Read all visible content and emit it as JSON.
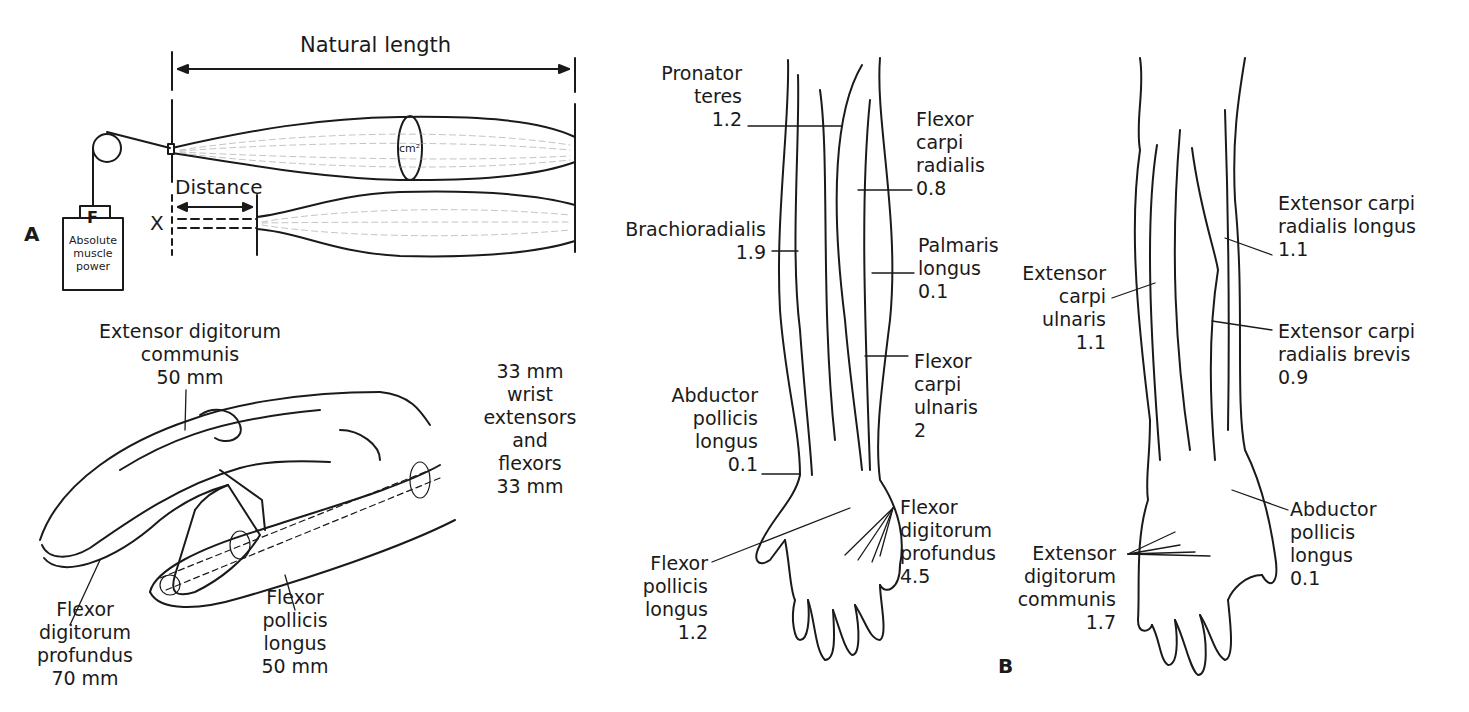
{
  "panel_a": {
    "letter": "A",
    "natural_length_label": "Natural length",
    "distance_label": "Distance",
    "cross_section_label": "cm²",
    "x_label": "X",
    "force_label": "F",
    "box_label": [
      "Absolute",
      "muscle",
      "power"
    ]
  },
  "hand_figure": {
    "edc": {
      "name": [
        "Extensor digitorum",
        "communis"
      ],
      "value": "50 mm"
    },
    "wrist": {
      "lines": [
        "33 mm",
        "wrist",
        "extensors",
        "and",
        "flexors",
        "33 mm"
      ]
    },
    "fdp": {
      "name": [
        "Flexor",
        "digitorum",
        "profundus"
      ],
      "value": "70 mm"
    },
    "fpl": {
      "name": [
        "Flexor",
        "pollicis",
        "longus"
      ],
      "value": "50 mm"
    }
  },
  "panel_b": {
    "letter": "B",
    "anterior": [
      {
        "id": "pronator-teres",
        "name": [
          "Pronator",
          "teres"
        ],
        "value": "1.2"
      },
      {
        "id": "flexor-carpi-radialis",
        "name": [
          "Flexor",
          "carpi",
          "radialis"
        ],
        "value": "0.8"
      },
      {
        "id": "brachioradialis",
        "name": [
          "Brachioradialis"
        ],
        "value": "1.9"
      },
      {
        "id": "palmaris-longus",
        "name": [
          "Palmaris",
          "longus"
        ],
        "value": "0.1"
      },
      {
        "id": "flexor-carpi-ulnaris",
        "name": [
          "Flexor",
          "carpi",
          "ulnaris"
        ],
        "value": "2"
      },
      {
        "id": "abductor-pollicis-longus",
        "name": [
          "Abductor",
          "pollicis",
          "longus"
        ],
        "value": "0.1"
      },
      {
        "id": "flexor-digitorum-profundus",
        "name": [
          "Flexor",
          "digitorum",
          "profundus"
        ],
        "value": "4.5"
      },
      {
        "id": "flexor-pollicis-longus",
        "name": [
          "Flexor",
          "pollicis",
          "longus"
        ],
        "value": "1.2"
      }
    ],
    "posterior": [
      {
        "id": "extensor-carpi-radialis-longus",
        "name": [
          "Extensor carpi",
          "radialis longus"
        ],
        "value": "1.1"
      },
      {
        "id": "extensor-carpi-ulnaris",
        "name": [
          "Extensor",
          "carpi",
          "ulnaris"
        ],
        "value": "1.1"
      },
      {
        "id": "extensor-carpi-radialis-brevis",
        "name": [
          "Extensor carpi",
          "radialis brevis"
        ],
        "value": "0.9"
      },
      {
        "id": "abductor-pollicis-longus-post",
        "name": [
          "Abductor",
          "pollicis",
          "longus"
        ],
        "value": "0.1"
      },
      {
        "id": "extensor-digitorum-communis",
        "name": [
          "Extensor",
          "digitorum",
          "communis"
        ],
        "value": "1.7"
      }
    ]
  }
}
